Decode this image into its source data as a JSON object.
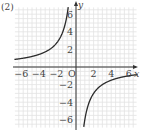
{
  "problem_label": "(2)",
  "chart_data": {
    "type": "line",
    "title": "",
    "function": "y = -6/x",
    "xlabel": "x",
    "ylabel": "y",
    "origin_label": "O",
    "xlim": [
      -7,
      7
    ],
    "ylim": [
      -7,
      7
    ],
    "grid": true,
    "grid_step": 1,
    "x_ticks": [
      -6,
      -4,
      -2,
      2,
      4,
      6
    ],
    "x_tick_labels": [
      "−6",
      "−4",
      "−2",
      "2",
      "4",
      "6"
    ],
    "y_ticks": [
      6,
      4,
      2,
      -2,
      -4,
      -6
    ],
    "y_tick_labels": [
      "6",
      "4",
      "2",
      "−2",
      "−4",
      "−6"
    ],
    "series": [
      {
        "name": "branch-left",
        "x": [
          -7,
          -6,
          -5,
          -4,
          -3,
          -2,
          -1.5,
          -1,
          -0.86
        ],
        "y": [
          0.857,
          1,
          1.2,
          1.5,
          2,
          3,
          4,
          6,
          7
        ]
      },
      {
        "name": "branch-right",
        "x": [
          0.86,
          1,
          1.5,
          2,
          3,
          4,
          5,
          6,
          7
        ],
        "y": [
          -7,
          -6,
          -4,
          -3,
          -2,
          -1.5,
          -1.2,
          -1,
          -0.857
        ]
      }
    ],
    "colors": {
      "curve": "#2a2a2a",
      "axis": "#333333",
      "grid": "#e2e2e2",
      "text": "#444444"
    }
  }
}
